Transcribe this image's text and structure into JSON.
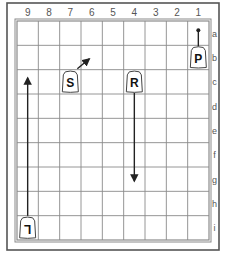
{
  "board": {
    "columns": [
      "9",
      "8",
      "7",
      "6",
      "5",
      "4",
      "3",
      "2",
      "1"
    ],
    "rows": [
      "a",
      "b",
      "c",
      "d",
      "e",
      "f",
      "g",
      "h",
      "i"
    ],
    "colors": {
      "frame": "#555555",
      "grid": "#8a8a8a",
      "label": "#555555",
      "piece_fill": "#ffffff",
      "piece_stroke": "#444444",
      "piece_text": "#111111",
      "arrow": "#222222"
    }
  },
  "pieces": [
    {
      "label": "P",
      "square": "1b",
      "col": 1,
      "row": "b",
      "name": "pawn"
    },
    {
      "label": "S",
      "square": "7c",
      "col": 7,
      "row": "c",
      "name": "silver"
    },
    {
      "label": "R",
      "square": "4c",
      "col": 4,
      "row": "c",
      "name": "rook"
    },
    {
      "label": "L",
      "square": "9i",
      "col": 9,
      "row": "i",
      "name": "lance",
      "inverted": true
    }
  ],
  "arrows": [
    {
      "name": "pawn-move",
      "from": "1b",
      "to": "1a"
    },
    {
      "name": "silver-move",
      "from": "7c",
      "to": "6b"
    },
    {
      "name": "rook-move",
      "from": "4c",
      "to": "4g"
    },
    {
      "name": "lance-move",
      "from": "9i",
      "to": "9c"
    }
  ]
}
